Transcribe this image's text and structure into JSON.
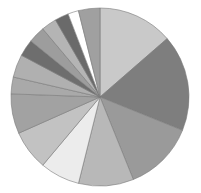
{
  "chart_data": {
    "type": "pie",
    "title": "",
    "legend": "none",
    "start": "top",
    "direction": "clockwise",
    "slices": [
      {
        "label": "",
        "value": 49,
        "color": "#c9c9c9"
      },
      {
        "label": "",
        "value": 63,
        "color": "#7e7e7e"
      },
      {
        "label": "",
        "value": 46,
        "color": "#9a9a9a"
      },
      {
        "label": "",
        "value": 36,
        "color": "#b8b8b8"
      },
      {
        "label": "",
        "value": 26,
        "color": "#ececec"
      },
      {
        "label": "",
        "value": 26,
        "color": "#c2c2c2"
      },
      {
        "label": "",
        "value": 26,
        "color": "#a2a2a2"
      },
      {
        "label": "",
        "value": 11,
        "color": "#a9a9a9"
      },
      {
        "label": "",
        "value": 15,
        "color": "#b0b0b0"
      },
      {
        "label": "",
        "value": 11,
        "color": "#6e6e6e"
      },
      {
        "label": "",
        "value": 11,
        "color": "#9d9d9d"
      },
      {
        "label": "",
        "value": 10,
        "color": "#b4b4b4"
      },
      {
        "label": "",
        "value": 9,
        "color": "#6a6a6a"
      },
      {
        "label": "",
        "value": 7,
        "color": "#ffffff"
      },
      {
        "label": "",
        "value": 14,
        "color": "#a0a0a0"
      }
    ]
  }
}
